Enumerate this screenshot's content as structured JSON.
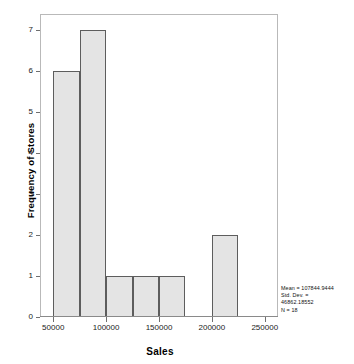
{
  "chart_data": {
    "type": "bar",
    "title": "",
    "xlabel": "Sales",
    "ylabel": "Frequency of Stores",
    "bin_width": 25000,
    "bin_start": 50000,
    "categories": [
      "50000-75000",
      "75000-100000",
      "100000-125000",
      "125000-150000",
      "150000-175000",
      "175000-200000",
      "200000-225000"
    ],
    "bin_edges": [
      50000,
      75000,
      100000,
      125000,
      150000,
      175000,
      200000,
      225000
    ],
    "values": [
      6,
      7,
      1,
      1,
      1,
      0,
      2
    ],
    "xlim": [
      37500,
      262500
    ],
    "ylim": [
      0,
      7.4
    ],
    "x_ticks": [
      "50000",
      "100000",
      "150000",
      "200000",
      "250000"
    ],
    "x_tick_values": [
      50000,
      100000,
      150000,
      200000,
      250000
    ],
    "y_ticks": [
      "0",
      "1",
      "2",
      "3",
      "4",
      "5",
      "6",
      "7"
    ],
    "y_tick_values": [
      0,
      1,
      2,
      3,
      4,
      5,
      6,
      7
    ],
    "grid": false,
    "legend": "none",
    "bar_fill_color": "#e4e4e4",
    "bar_edge_color": "#5d5d5d",
    "annotations": {
      "mean_line": "Mean = 107844.9444",
      "std_dev_line_1": "Std. Dev. =",
      "std_dev_line_2": "46862.18552",
      "n_line": "N = 18"
    }
  },
  "axes": {
    "x_title": "Sales",
    "y_title": "Frequency of Stores"
  },
  "stats": {
    "mean": "Mean = 107844.9444",
    "std_dev_label": "Std. Dev. =",
    "std_dev_value": "46862.18552",
    "n": "N = 18"
  }
}
